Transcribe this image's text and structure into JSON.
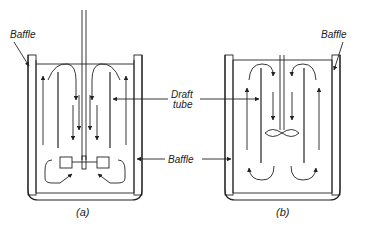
{
  "figure": {
    "labels": {
      "baffle_top_left": "Baffle",
      "baffle_top_right": "Baffle",
      "draft_tube": [
        "Draft",
        "tube"
      ],
      "baffle_middle": "Baffle"
    },
    "captions": {
      "a": "(a)",
      "b": "(b)"
    },
    "panels": [
      {
        "id": "a",
        "impeller": "flat-blade turbine",
        "flow": "down inside draft tube, up in annulus"
      },
      {
        "id": "b",
        "impeller": "marine propeller",
        "flow": "down inside draft tube, up in annulus"
      }
    ],
    "colors": {
      "line": "#222222",
      "background": "#ffffff"
    }
  }
}
